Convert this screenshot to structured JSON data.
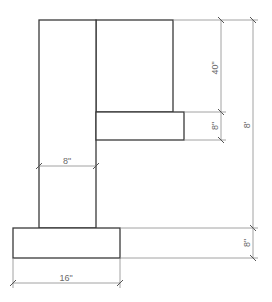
{
  "drawing": {
    "type": "dimensioned elevation drawing",
    "shapes": [
      {
        "name": "vertical-column",
        "x": 39,
        "y": 20,
        "width": 57,
        "height": 208
      },
      {
        "name": "upper-box",
        "x": 96,
        "y": 20,
        "width": 77,
        "height": 92
      },
      {
        "name": "shelf",
        "x": 96,
        "y": 112,
        "width": 88,
        "height": 28
      },
      {
        "name": "base-footing",
        "x": 13,
        "y": 228,
        "width": 107,
        "height": 30
      }
    ],
    "dimensions": {
      "upper_box_height": "40\"",
      "shelf_thickness": "8\"",
      "overall_height": "8'",
      "column_width": "8\"",
      "base_thickness": "8\"",
      "base_width": "16\""
    },
    "colors": {
      "object_line": "#3a3a3a",
      "dimension_line": "#8a8a8a",
      "label_text": "#6a6a6a",
      "background": "#ffffff"
    }
  }
}
